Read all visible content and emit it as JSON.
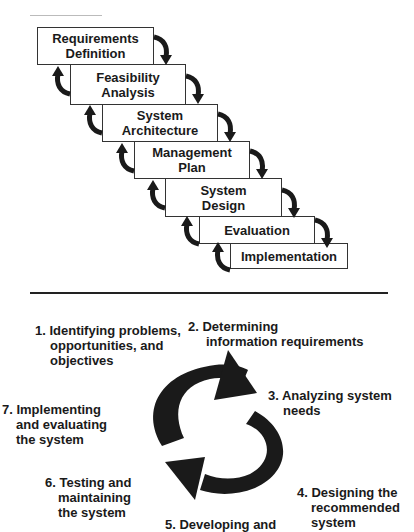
{
  "waterfall": {
    "stages": [
      {
        "line1": "Requirements",
        "line2": "Definition"
      },
      {
        "line1": "Feasibility",
        "line2": "Analysis"
      },
      {
        "line1": "System",
        "line2": "Architecture"
      },
      {
        "line1": "Management",
        "line2": "Plan"
      },
      {
        "line1": "System",
        "line2": "Design"
      },
      {
        "line1": "Evaluation",
        "line2": ""
      },
      {
        "line1": "Implementation",
        "line2": ""
      }
    ]
  },
  "cycle": {
    "steps": [
      {
        "l1": "1.  Identifying problems,",
        "l2": "opportunities, and",
        "l3": "objectives"
      },
      {
        "l1": "2.  Determining",
        "l2": "information requirements",
        "l3": ""
      },
      {
        "l1": "3. Analyzing system",
        "l2": "needs",
        "l3": ""
      },
      {
        "l1": "4. Designing the",
        "l2": "recommended",
        "l3": "system"
      },
      {
        "l1": "5. Developing and",
        "l2": "",
        "l3": ""
      },
      {
        "l1": "6. Testing and",
        "l2": "maintaining",
        "l3": "the system"
      },
      {
        "l1": "7. Implementing",
        "l2": "and evaluating",
        "l3": "the system"
      }
    ]
  },
  "colors": {
    "ink": "#1a1a1a",
    "background": "#ffffff"
  }
}
